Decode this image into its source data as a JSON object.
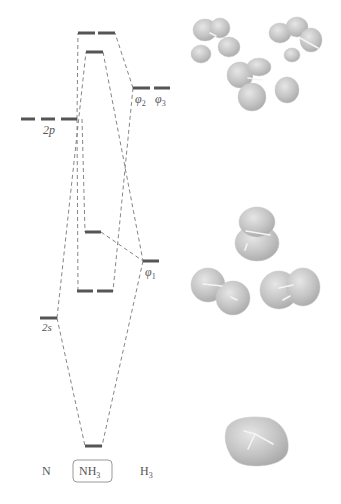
{
  "diagram": {
    "type": "molecular orbital energy-level diagram",
    "columns": {
      "left": "N",
      "center": "NH",
      "center_subscript": "3",
      "right": "H",
      "right_subscript": "3"
    },
    "atomic_orbitals_N": [
      {
        "label": "2p",
        "degeneracy": 3
      },
      {
        "label": "2s",
        "degeneracy": 1
      }
    ],
    "group_orbitals_H3": [
      {
        "label_main": "φ",
        "label_sub": "2",
        "degeneracy": 1
      },
      {
        "label_main": "φ",
        "label_sub": "3",
        "degeneracy": 1
      },
      {
        "label_main": "φ",
        "label_sub": "1",
        "degeneracy": 1
      }
    ],
    "molecular_orbitals_NH3": [
      {
        "level": "antibonding-e",
        "degeneracy": 2
      },
      {
        "level": "antibonding-a1",
        "degeneracy": 1
      },
      {
        "level": "nonbonding-a1",
        "degeneracy": 1
      },
      {
        "level": "bonding-e",
        "degeneracy": 2
      },
      {
        "level": "bonding-a1",
        "degeneracy": 1
      }
    ],
    "orbital_images": [
      {
        "name": "antibonding-e-orbitals",
        "count": 3
      },
      {
        "name": "bonding-e-and-lone-pair-orbitals",
        "count": 3
      },
      {
        "name": "bonding-a1-orbital",
        "count": 1
      }
    ],
    "colors": {
      "level_bar": "#555555",
      "dashed_line": "#777777",
      "orbital_surface": "#bdbdbd"
    }
  }
}
